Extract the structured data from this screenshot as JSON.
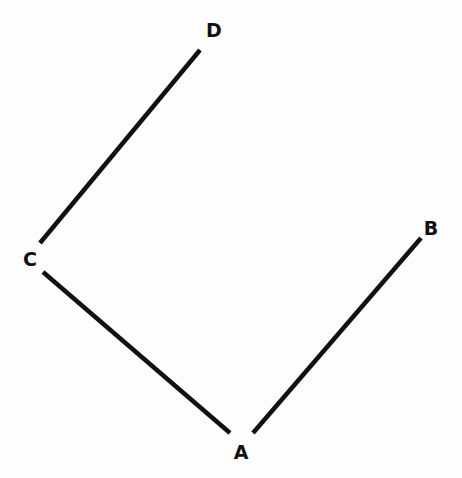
{
  "diagram": {
    "type": "graph",
    "nodes": [
      {
        "id": "A",
        "label": "A",
        "x": 241,
        "y": 452
      },
      {
        "id": "B",
        "label": "B",
        "x": 431,
        "y": 228
      },
      {
        "id": "C",
        "label": "C",
        "x": 30,
        "y": 259
      },
      {
        "id": "D",
        "label": "D",
        "x": 214,
        "y": 30
      }
    ],
    "edges": [
      {
        "from": "C",
        "to": "D",
        "x1": 40,
        "y1": 243,
        "x2": 200,
        "y2": 50
      },
      {
        "from": "C",
        "to": "A",
        "x1": 43,
        "y1": 272,
        "x2": 230,
        "y2": 433
      },
      {
        "from": "A",
        "to": "B",
        "x1": 253,
        "y1": 433,
        "x2": 421,
        "y2": 238
      }
    ],
    "colors": {
      "line": "#111111",
      "background": "#fdfdfd"
    }
  }
}
